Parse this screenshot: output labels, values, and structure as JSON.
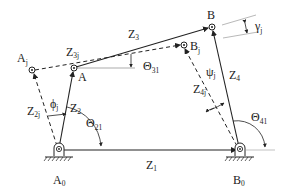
{
  "diagram": {
    "type": "four-bar linkage mechanism",
    "colors": {
      "line": "#222222",
      "background": "#ffffff",
      "reference": "#888888"
    },
    "points": {
      "A0": {
        "main": "A",
        "sub": "0"
      },
      "B0": {
        "main": "B",
        "sub": "0"
      },
      "A": {
        "main": "A",
        "sub": ""
      },
      "B": {
        "main": "B",
        "sub": ""
      },
      "Aj": {
        "main": "A",
        "sub": "j"
      },
      "Bj": {
        "main": "B",
        "sub": "j"
      }
    },
    "links": {
      "Z1": {
        "main": "Z",
        "sub": "1"
      },
      "Z2": {
        "main": "Z",
        "sub": "2"
      },
      "Z3": {
        "main": "Z",
        "sub": "3"
      },
      "Z4": {
        "main": "Z",
        "sub": "4"
      },
      "Z2j": {
        "main": "Z",
        "sub": "2j"
      },
      "Z3j": {
        "main": "Z",
        "sub": "3j"
      },
      "Z4j": {
        "main": "Z",
        "sub": "4j"
      }
    },
    "angles": {
      "theta21": {
        "main": "Θ",
        "sub": "21"
      },
      "theta31": {
        "main": "Θ",
        "sub": "31"
      },
      "theta41": {
        "main": "Θ",
        "sub": "41"
      },
      "phij": {
        "main": "ϕ",
        "sub": "j"
      },
      "psij": {
        "main": "ψ",
        "sub": "j"
      },
      "gammaj": {
        "main": "γ",
        "sub": "j"
      }
    }
  }
}
